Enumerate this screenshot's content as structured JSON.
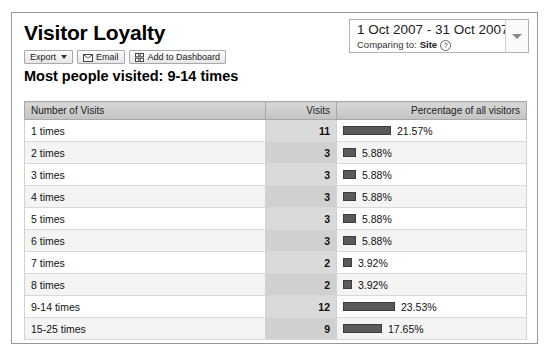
{
  "header": {
    "title": "Visitor Loyalty",
    "subtitle": "Most people visited: 9-14 times"
  },
  "toolbar": {
    "export_label": "Export",
    "email_label": "Email",
    "dashboard_label": "Add to Dashboard",
    "export_icon": "chevron-down-icon",
    "email_icon": "envelope-icon",
    "dashboard_icon": "grid-icon"
  },
  "date_range": {
    "range_text": "1 Oct 2007 - 31 Oct 2007",
    "comparing_label": "Comparing to:",
    "comparing_value": "Site",
    "help_glyph": "?",
    "toggle_icon": "chevron-down-icon"
  },
  "table": {
    "columns": {
      "label": "Number of Visits",
      "visits": "Visits",
      "percentage": "Percentage of all visitors"
    },
    "rows": [
      {
        "label": "1 times",
        "visits": "11",
        "percent_text": "21.57%",
        "percent_value": 21.57
      },
      {
        "label": "2 times",
        "visits": "3",
        "percent_text": "5.88%",
        "percent_value": 5.88
      },
      {
        "label": "3 times",
        "visits": "3",
        "percent_text": "5.88%",
        "percent_value": 5.88
      },
      {
        "label": "4 times",
        "visits": "3",
        "percent_text": "5.88%",
        "percent_value": 5.88
      },
      {
        "label": "5 times",
        "visits": "3",
        "percent_text": "5.88%",
        "percent_value": 5.88
      },
      {
        "label": "6 times",
        "visits": "3",
        "percent_text": "5.88%",
        "percent_value": 5.88
      },
      {
        "label": "7 times",
        "visits": "2",
        "percent_text": "3.92%",
        "percent_value": 3.92
      },
      {
        "label": "8 times",
        "visits": "2",
        "percent_text": "3.92%",
        "percent_value": 3.92
      },
      {
        "label": "9-14 times",
        "visits": "12",
        "percent_text": "23.53%",
        "percent_value": 23.53
      },
      {
        "label": "15-25 times",
        "visits": "9",
        "percent_text": "17.65%",
        "percent_value": 17.65
      }
    ]
  },
  "chart_data": {
    "type": "bar",
    "title": "Visitor Loyalty",
    "subtitle": "Most people visited: 9-14 times",
    "xlabel": "Number of Visits",
    "ylabel": "Percentage of all visitors",
    "categories": [
      "1 times",
      "2 times",
      "3 times",
      "4 times",
      "5 times",
      "6 times",
      "7 times",
      "8 times",
      "9-14 times",
      "15-25 times"
    ],
    "series": [
      {
        "name": "Visits",
        "values": [
          11,
          3,
          3,
          3,
          3,
          3,
          2,
          2,
          12,
          9
        ]
      },
      {
        "name": "Percentage of all visitors",
        "values": [
          21.57,
          5.88,
          5.88,
          5.88,
          5.88,
          5.88,
          3.92,
          3.92,
          23.53,
          17.65
        ]
      }
    ],
    "ylim": [
      0,
      23.53
    ],
    "grid": false,
    "legend": "none",
    "bar_color": "#5a5a5a"
  },
  "colors": {
    "bar": "#5a5a5a",
    "header_bg": "#cccccc",
    "visits_col_bg": "#dadada",
    "panel_border": "#999999"
  }
}
